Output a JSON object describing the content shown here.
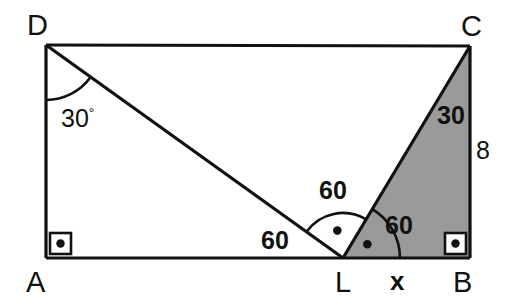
{
  "figure": {
    "type": "geometry-diagram",
    "background_color": "#ffffff",
    "stroke_color": "#111111",
    "shade_color": "#9a9a9a"
  },
  "vertices": {
    "D": {
      "label": "D",
      "x": 46,
      "y": 45
    },
    "C": {
      "label": "C",
      "x": 470,
      "y": 46
    },
    "A": {
      "label": "A",
      "x": 46,
      "y": 258
    },
    "B": {
      "label": "B",
      "x": 470,
      "y": 258
    },
    "L": {
      "label": "L",
      "x": 343,
      "y": 258
    }
  },
  "vertex_labels": [
    {
      "name": "vertex-label-D",
      "text": "D",
      "left": 27,
      "top": 11
    },
    {
      "name": "vertex-label-C",
      "text": "C",
      "left": 461,
      "top": 12
    },
    {
      "name": "vertex-label-A",
      "text": "A",
      "left": 26,
      "top": 268
    },
    {
      "name": "vertex-label-L",
      "text": "L",
      "left": 335,
      "top": 268
    },
    {
      "name": "vertex-label-B",
      "text": "B",
      "left": 453,
      "top": 268
    }
  ],
  "angle_labels": [
    {
      "name": "angle-label-adl",
      "text": "30",
      "degree": "°",
      "left": 61,
      "top": 106,
      "style": "plain"
    },
    {
      "name": "angle-label-dlc",
      "text": "60",
      "left": 319,
      "top": 178,
      "style": "bold"
    },
    {
      "name": "angle-label-dla",
      "text": "60",
      "left": 261,
      "top": 228,
      "style": "bold"
    },
    {
      "name": "angle-label-clb",
      "text": "60",
      "left": 385,
      "top": 213,
      "style": "bold"
    },
    {
      "name": "angle-label-lcb",
      "text": "30",
      "left": 437,
      "top": 103,
      "style": "bold"
    }
  ],
  "side_labels": [
    {
      "name": "side-label-cb",
      "text": "8",
      "left": 476,
      "top": 138,
      "style": "plain"
    },
    {
      "name": "side-label-lb",
      "text": "x",
      "left": 390,
      "top": 268,
      "style": "bold-x"
    }
  ],
  "right_angle_marks": [
    {
      "name": "right-angle-mark-a",
      "x": 46,
      "y": 258,
      "dir_x": 1,
      "dir_y": -1
    },
    {
      "name": "right-angle-mark-b",
      "x": 470,
      "y": 258,
      "dir_x": -1,
      "dir_y": -1
    }
  ],
  "segments": [
    {
      "name": "segment-DA",
      "from": "D",
      "to": "A"
    },
    {
      "name": "segment-DC",
      "from": "D",
      "to": "C"
    },
    {
      "name": "segment-AB",
      "from": "A",
      "to": "B"
    },
    {
      "name": "segment-CB",
      "from": "C",
      "to": "B"
    },
    {
      "name": "segment-DL",
      "from": "D",
      "to": "L"
    },
    {
      "name": "segment-LC",
      "from": "L",
      "to": "C"
    }
  ],
  "shaded_region": {
    "name": "shaded-triangle-LCB",
    "points": "L,C,B",
    "fill": "#9a9a9a"
  },
  "arc_marks": [
    {
      "name": "arc-angle-at-D",
      "vertex": "D",
      "radius": 55,
      "dot": false
    },
    {
      "name": "arc-angle-DLC",
      "vertex": "L",
      "radius": 45,
      "dot": true
    },
    {
      "name": "arc-angle-CLB",
      "vertex": "L",
      "radius": 57,
      "dot": true
    }
  ],
  "chart_data": {
    "type": "diagram",
    "shape": "rectangle ABCD",
    "known_values": {
      "angle_ADL_deg": 30,
      "angle_ALD_deg": 60,
      "angle_DLC_deg": 60,
      "angle_CLB_deg": 60,
      "angle_LCB_deg": 30,
      "side_CB": 8,
      "side_LB": "x",
      "angle_A_deg": 90,
      "angle_B_deg": 90
    }
  }
}
